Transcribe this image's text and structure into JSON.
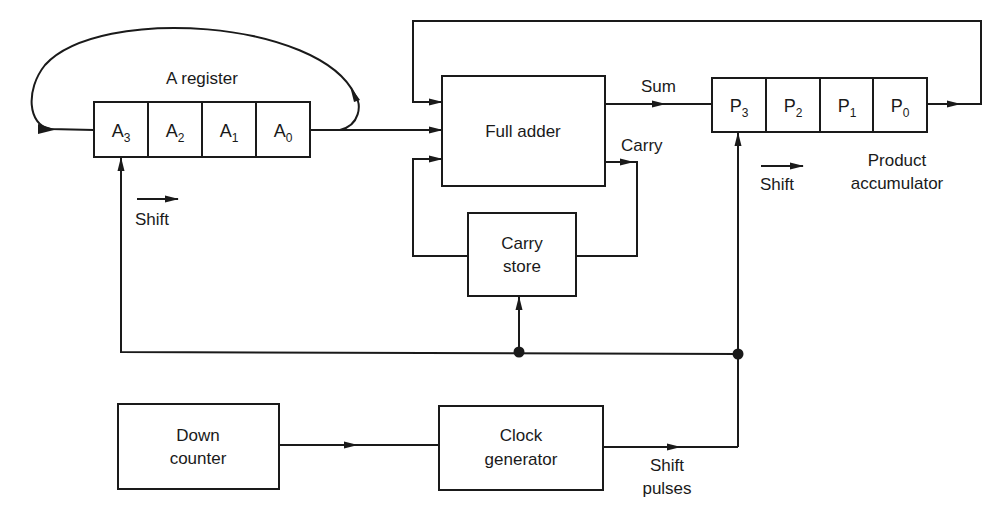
{
  "diagram": {
    "type": "block-diagram",
    "blocks": {
      "a_register": {
        "title": "A register",
        "cells": [
          {
            "base": "A",
            "sub": "3"
          },
          {
            "base": "A",
            "sub": "2"
          },
          {
            "base": "A",
            "sub": "1"
          },
          {
            "base": "A",
            "sub": "0"
          }
        ],
        "shift_label": "Shift"
      },
      "full_adder": {
        "label": "Full adder"
      },
      "carry_store": {
        "line1": "Carry",
        "line2": "store"
      },
      "product_accumulator": {
        "cells": [
          {
            "base": "P",
            "sub": "3"
          },
          {
            "base": "P",
            "sub": "2"
          },
          {
            "base": "P",
            "sub": "1"
          },
          {
            "base": "P",
            "sub": "0"
          }
        ],
        "shift_label": "Shift",
        "title_line1": "Product",
        "title_line2": "accumulator"
      },
      "down_counter": {
        "line1": "Down",
        "line2": "counter"
      },
      "clock_generator": {
        "line1": "Clock",
        "line2": "generator"
      }
    },
    "signals": {
      "sum": "Sum",
      "carry": "Carry",
      "shift_pulses_line1": "Shift",
      "shift_pulses_line2": "pulses"
    },
    "connections": [
      {
        "from": "A0",
        "to": "A3",
        "kind": "circular feedback arc"
      },
      {
        "from": "A0",
        "to": "Full adder",
        "kind": "data"
      },
      {
        "from": "P0",
        "to": "Full adder",
        "kind": "feedback loop over top"
      },
      {
        "from": "Carry store",
        "to": "Full adder",
        "kind": "carry in"
      },
      {
        "from": "Full adder",
        "to": "P3",
        "label": "Sum"
      },
      {
        "from": "Full adder",
        "to": "Carry store",
        "label": "Carry"
      },
      {
        "from": "Down counter",
        "to": "Clock generator"
      },
      {
        "from": "Clock generator",
        "to": "P3 / Carry store / A3",
        "label": "Shift pulses"
      }
    ]
  }
}
